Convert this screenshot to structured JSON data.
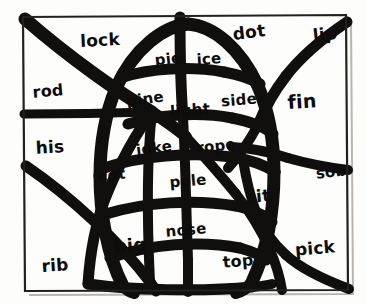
{
  "page": {
    "kind": "hand-drawn word web puzzle",
    "background_color": "#fdfdfc",
    "ink_color": "#100f0d",
    "frame_color": "#23211e"
  },
  "words": [
    {
      "text": "lock",
      "x": 100,
      "y": 40,
      "size": 17,
      "rot": -3
    },
    {
      "text": "dot",
      "x": 249,
      "y": 32,
      "size": 17,
      "rot": -7
    },
    {
      "text": "lip",
      "x": 325,
      "y": 34,
      "size": 17,
      "rot": -6
    },
    {
      "text": "pie",
      "x": 168,
      "y": 59,
      "size": 15,
      "rot": -6
    },
    {
      "text": "ice",
      "x": 209,
      "y": 59,
      "size": 15,
      "rot": -4
    },
    {
      "text": "rod",
      "x": 48,
      "y": 91,
      "size": 16,
      "rot": -5
    },
    {
      "text": "pine",
      "x": 145,
      "y": 99,
      "size": 15,
      "rot": -8
    },
    {
      "text": "light",
      "x": 190,
      "y": 110,
      "size": 15,
      "rot": -4
    },
    {
      "text": "side",
      "x": 239,
      "y": 100,
      "size": 15,
      "rot": -5
    },
    {
      "text": "fin",
      "x": 302,
      "y": 101,
      "size": 19,
      "rot": -4
    },
    {
      "text": "his",
      "x": 50,
      "y": 147,
      "size": 17,
      "rot": -3
    },
    {
      "text": "joke",
      "x": 154,
      "y": 148,
      "size": 15,
      "rot": -7
    },
    {
      "text": "rope",
      "x": 216,
      "y": 146,
      "size": 15,
      "rot": -6
    },
    {
      "text": "cot",
      "x": 112,
      "y": 175,
      "size": 15,
      "rot": -7
    },
    {
      "text": "pole",
      "x": 188,
      "y": 181,
      "size": 15,
      "rot": -5
    },
    {
      "text": "sob",
      "x": 331,
      "y": 172,
      "size": 15,
      "rot": -7
    },
    {
      "text": "sit",
      "x": 258,
      "y": 196,
      "size": 17,
      "rot": -5
    },
    {
      "text": "nose",
      "x": 186,
      "y": 230,
      "size": 15,
      "rot": -5
    },
    {
      "text": "big",
      "x": 130,
      "y": 245,
      "size": 18,
      "rot": -4
    },
    {
      "text": "top",
      "x": 238,
      "y": 261,
      "size": 16,
      "rot": -5
    },
    {
      "text": "pick",
      "x": 315,
      "y": 248,
      "size": 17,
      "rot": -5
    },
    {
      "text": "rib",
      "x": 55,
      "y": 265,
      "size": 17,
      "rot": -4
    }
  ],
  "web": {
    "frame": "M 23,17 L 346,15 L 348,290 L 25,291 Z",
    "frame_shadow": "M 351,19 L 353,294 L 29,295",
    "strokes": [
      {
        "d": "M 25,19 C 70,58 118,92 152,112",
        "w": 13
      },
      {
        "d": "M 152,112 C 170,124 180,131 186,137",
        "w": 12
      },
      {
        "d": "M 24,114 C 70,114 120,113 152,112",
        "w": 9
      },
      {
        "d": "M 26,166 C 70,196 120,242 150,282",
        "w": 11
      },
      {
        "d": "M 150,282 C 152,285 154,288 156,291",
        "w": 11
      },
      {
        "d": "M 152,112 C 148,148 146,200 150,282",
        "w": 10
      },
      {
        "d": "M 180,17 C 180,40 180,80 183,118",
        "w": 11
      },
      {
        "d": "M 183,118 C 185,150 186,200 188,260",
        "w": 10
      },
      {
        "d": "M 188,260 C 188,275 188,285 188,292",
        "w": 10
      },
      {
        "d": "M 347,22 C 320,40 300,58 286,76",
        "w": 11
      },
      {
        "d": "M 286,76 C 272,94 264,110 258,125",
        "w": 11
      },
      {
        "d": "M 258,125 C 250,140 240,155 228,168",
        "w": 10
      },
      {
        "d": "M 348,170 C 325,167 305,163 288,158",
        "w": 10
      },
      {
        "d": "M 288,158 C 270,152 250,148 232,147",
        "w": 10
      },
      {
        "d": "M 349,289 C 320,278 300,268 286,255",
        "w": 10
      },
      {
        "d": "M 286,255 C 272,242 262,228 256,212",
        "w": 10
      },
      {
        "d": "M 256,212 C 250,196 246,178 243,160",
        "w": 10
      },
      {
        "d": "M 152,112 C 140,128 122,158 106,196",
        "w": 11
      },
      {
        "d": "M 106,196 C 96,222 90,252 88,284",
        "w": 11
      },
      {
        "d": "M 186,137 C 200,152 218,172 236,194",
        "w": 10
      },
      {
        "d": "M 236,194 C 250,212 262,232 270,250",
        "w": 10
      },
      {
        "d": "M 270,250 C 276,264 280,278 282,290",
        "w": 10
      },
      {
        "d": "M 116,88 C 134,48 164,26 188,24",
        "w": 13
      },
      {
        "d": "M 188,24 C 214,26 240,48 258,86",
        "w": 13
      },
      {
        "d": "M 258,86 C 268,110 274,140 274,172",
        "w": 13
      },
      {
        "d": "M 274,172 C 274,214 266,252 252,282",
        "w": 13
      },
      {
        "d": "M 252,282 C 246,290 240,292 236,293",
        "w": 12
      },
      {
        "d": "M 116,88 C 106,112 100,144 100,176",
        "w": 13
      },
      {
        "d": "M 100,176 C 100,216 108,256 122,284",
        "w": 13
      },
      {
        "d": "M 122,284 C 126,290 130,292 134,293",
        "w": 12
      },
      {
        "d": "M 120,78 C 150,68 190,66 224,72",
        "w": 11
      },
      {
        "d": "M 224,72 C 240,75 252,79 260,84",
        "w": 11
      },
      {
        "d": "M 128,124 C 160,114 200,112 232,118",
        "w": 11
      },
      {
        "d": "M 232,118 C 252,122 266,128 273,134",
        "w": 11
      },
      {
        "d": "M 104,168 C 140,156 190,152 232,157",
        "w": 11
      },
      {
        "d": "M 232,157 C 252,160 266,166 275,172",
        "w": 11
      },
      {
        "d": "M 106,214 C 145,202 195,199 236,206",
        "w": 11
      },
      {
        "d": "M 236,206 C 254,210 266,216 272,222",
        "w": 11
      },
      {
        "d": "M 110,258 C 150,244 200,240 240,248",
        "w": 11
      },
      {
        "d": "M 240,248 C 254,252 262,256 266,260",
        "w": 11
      },
      {
        "d": "M 88,284 C 130,290 200,292 252,287",
        "w": 11
      },
      {
        "d": "M 252,287 C 262,286 268,285 272,284",
        "w": 10
      }
    ]
  }
}
